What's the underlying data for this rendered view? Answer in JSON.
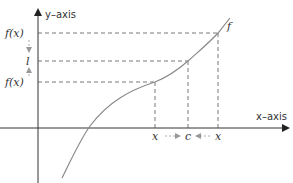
{
  "diagram": {
    "type": "limit-definition-graph",
    "axes": {
      "y_label": "y–axis",
      "x_label": "x–axis"
    },
    "curve_label": "f",
    "y_labels": {
      "upper": "f(x)",
      "limit": "l",
      "lower": "f(x)"
    },
    "x_labels": {
      "left": "x",
      "center": "c",
      "right": "x"
    },
    "colors": {
      "axis": "#333333",
      "curve": "#8a8a8a",
      "dashed": "#555555",
      "arrow": "#999999",
      "text": "#333333"
    }
  }
}
